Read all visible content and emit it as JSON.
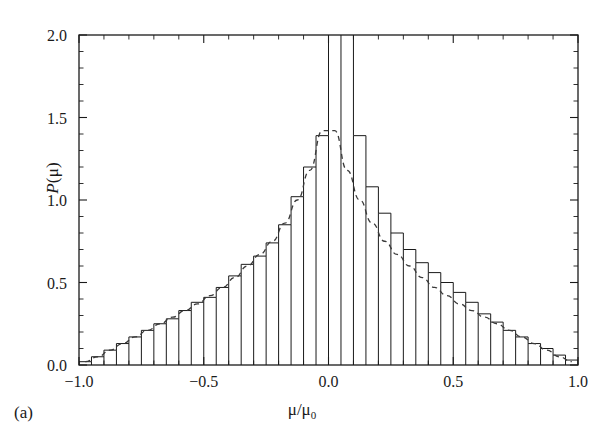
{
  "figure": {
    "panel_label": "(a)",
    "xlabel": "μ/μ",
    "xlabel_sub": "0",
    "ylabel_italic": "P",
    "ylabel_rest": "(μ)"
  },
  "chart_data": {
    "type": "bar",
    "title": "",
    "subtitle": "",
    "xlabel": "μ/μ₀",
    "ylabel": "P(μ)",
    "xlim": [
      -1.0,
      1.0
    ],
    "ylim": [
      0.0,
      2.0
    ],
    "xticks": [
      -1.0,
      -0.5,
      0.0,
      0.5,
      1.0
    ],
    "xtick_labels": [
      "−1.0",
      "−0.5",
      "0.0",
      "0.5",
      "1.0"
    ],
    "yticks": [
      0.0,
      0.5,
      1.0,
      1.5,
      2.0
    ],
    "ytick_labels": [
      "0.0",
      "0.5",
      "1.0",
      "1.5",
      "2.0"
    ],
    "x_minor_tick_step": 0.1,
    "y_minor_tick_step": 0.1,
    "grid": false,
    "legend": null,
    "bin_width": 0.05,
    "bin_edges": [
      -1.0,
      -0.95,
      -0.9,
      -0.85,
      -0.8,
      -0.75,
      -0.7,
      -0.65,
      -0.6,
      -0.55,
      -0.5,
      -0.45,
      -0.4,
      -0.35,
      -0.3,
      -0.25,
      -0.2,
      -0.15,
      -0.1,
      -0.05,
      0.0,
      0.05,
      0.1,
      0.15,
      0.2,
      0.25,
      0.3,
      0.35,
      0.4,
      0.45,
      0.5,
      0.55,
      0.6,
      0.65,
      0.7,
      0.75,
      0.8,
      0.85,
      0.9,
      0.95,
      1.0
    ],
    "bin_centers": [
      -0.975,
      -0.925,
      -0.875,
      -0.825,
      -0.775,
      -0.725,
      -0.675,
      -0.625,
      -0.575,
      -0.525,
      -0.475,
      -0.425,
      -0.375,
      -0.325,
      -0.275,
      -0.225,
      -0.175,
      -0.125,
      -0.075,
      -0.025,
      0.025,
      0.075,
      0.125,
      0.175,
      0.225,
      0.275,
      0.325,
      0.375,
      0.425,
      0.475,
      0.525,
      0.575,
      0.625,
      0.675,
      0.725,
      0.775,
      0.825,
      0.875,
      0.925,
      0.975
    ],
    "series": [
      {
        "name": "histogram",
        "style": "step",
        "clipped_at_top": true,
        "values": [
          0.02,
          0.05,
          0.09,
          0.13,
          0.17,
          0.21,
          0.25,
          0.28,
          0.33,
          0.38,
          0.41,
          0.47,
          0.54,
          0.61,
          0.66,
          0.74,
          0.85,
          1.02,
          1.2,
          1.39,
          2.2,
          2.2,
          1.39,
          1.08,
          0.92,
          0.8,
          0.7,
          0.62,
          0.56,
          0.5,
          0.44,
          0.38,
          0.31,
          0.26,
          0.21,
          0.17,
          0.13,
          0.1,
          0.06,
          0.03
        ]
      },
      {
        "name": "fit-curve",
        "style": "dashed",
        "values": [
          0.02,
          0.05,
          0.09,
          0.13,
          0.17,
          0.21,
          0.25,
          0.29,
          0.33,
          0.37,
          0.42,
          0.47,
          0.53,
          0.6,
          0.67,
          0.75,
          0.86,
          1.0,
          1.18,
          1.42,
          1.42,
          1.18,
          1.0,
          0.86,
          0.75,
          0.67,
          0.6,
          0.53,
          0.47,
          0.42,
          0.37,
          0.33,
          0.29,
          0.25,
          0.21,
          0.17,
          0.13,
          0.09,
          0.05,
          0.02
        ]
      }
    ]
  },
  "colors": {
    "axis": "#1a1a1a",
    "histogram": "#1a1a1a",
    "fit": "#3a3a3a",
    "background": "#ffffff"
  }
}
